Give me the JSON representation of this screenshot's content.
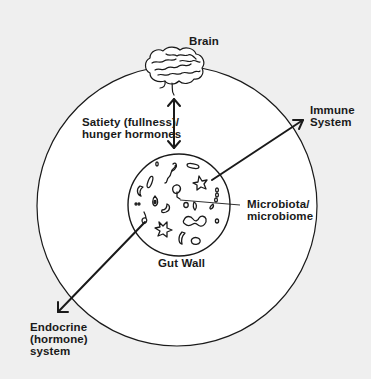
{
  "diagram": {
    "colors": {
      "background": "#efefef",
      "circle_fill": "#ffffff",
      "stroke": "#1a1a1a",
      "text": "#1a1a1a"
    },
    "nodes": {
      "brain": {
        "label": "Brain",
        "icon": "brain-icon"
      },
      "gut_wall": {
        "label": "Gut Wall"
      },
      "microbiota": {
        "line1": "Microbiota/",
        "line2": "microbiome"
      },
      "immune": {
        "line1": "Immune",
        "line2": "System"
      },
      "endocrine": {
        "line1": "Endocrine",
        "line2": "(hormone)",
        "line3": "system"
      }
    },
    "edges": {
      "brain_gut": {
        "line1": "Satiety (fullness)/",
        "line2": "hunger hormones",
        "direction": "bidirectional"
      },
      "gut_immune": {
        "direction": "to-immune"
      },
      "gut_endocrine": {
        "direction": "to-endocrine"
      }
    }
  }
}
